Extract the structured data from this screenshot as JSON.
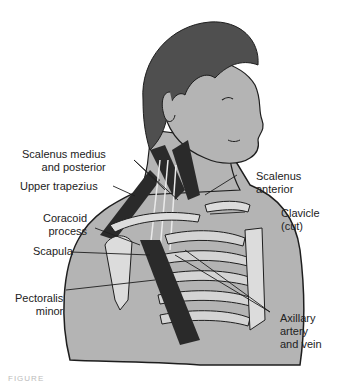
{
  "figure": {
    "colors": {
      "skin": "#b4b4b4",
      "hair": "#4f4f4f",
      "muscle": "#2a2a2a",
      "bone": "#dcdcdc",
      "outline": "#1e1e1e",
      "text": "#222222"
    },
    "labels": [
      {
        "id": "scalenus-medius-posterior",
        "lines": [
          "Scalenus medius",
          "and posterior"
        ]
      },
      {
        "id": "upper-trapezius",
        "lines": [
          "Upper trapezius"
        ]
      },
      {
        "id": "coracoid-process",
        "lines": [
          "Coracoid",
          "process"
        ]
      },
      {
        "id": "scapula",
        "lines": [
          "Scapula"
        ]
      },
      {
        "id": "pectoralis-minor",
        "lines": [
          "Pectoralis",
          "minor"
        ]
      },
      {
        "id": "scalenus-anterior",
        "lines": [
          "Scalenus",
          "anterior"
        ]
      },
      {
        "id": "clavicle",
        "lines": [
          "Clavicle",
          "(cut)"
        ]
      },
      {
        "id": "axillary-artery-vein",
        "lines": [
          "Axillary",
          "artery",
          "and vein"
        ]
      }
    ],
    "caption": "FIGURE"
  }
}
